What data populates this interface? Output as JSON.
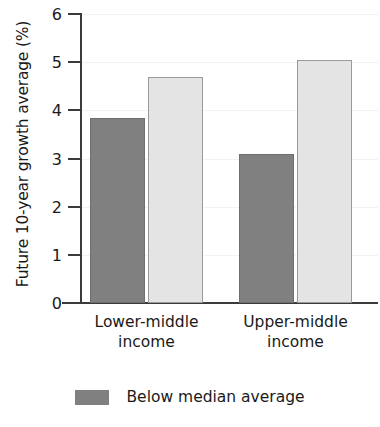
{
  "chart_data": {
    "type": "bar",
    "title": "",
    "xlabel": "",
    "ylabel": "Future 10-year growth average (%)",
    "categories": [
      "Lower-middle\nincome",
      "Upper-middle\nincome"
    ],
    "category_labels": [
      {
        "line1": "Lower-middle",
        "line2": "income"
      },
      {
        "line1": "Upper-middle",
        "line2": "income"
      }
    ],
    "series": [
      {
        "name": "Below median average",
        "values": [
          3.85,
          3.1
        ],
        "color": "#808080"
      },
      {
        "name": "",
        "values": [
          4.7,
          5.05
        ],
        "color": "#e4e4e4"
      }
    ],
    "ylim": [
      0,
      6
    ],
    "yticks": [
      0,
      1,
      2,
      3,
      4,
      5,
      6
    ],
    "ytick_labels": [
      "0",
      "1",
      "2",
      "3",
      "4",
      "5",
      "6"
    ],
    "grid": true,
    "legend_position": "bottom",
    "legend_entries": [
      {
        "label": "Below median average",
        "color": "#808080"
      }
    ]
  }
}
